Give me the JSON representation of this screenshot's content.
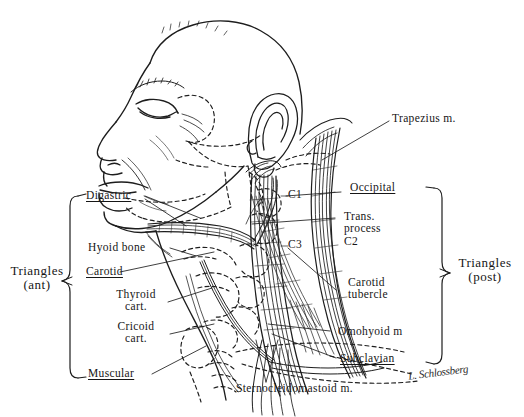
{
  "figure": {
    "ink_color": "#1d1d1d",
    "background": "#ffffff"
  },
  "brackets": {
    "left": {
      "label_line1": "Triangles",
      "label_line2": "(ant)"
    },
    "right": {
      "label_line1": "Triangles",
      "label_line2": "(post)"
    }
  },
  "labels": {
    "digastric": "Digastric",
    "hyoid_bone": "Hyoid bone",
    "carotid": "Carotid",
    "thyroid_cart_1": "Thyroid",
    "thyroid_cart_2": "cart.",
    "cricoid_cart_1": "Cricoid",
    "cricoid_cart_2": "cart.",
    "muscular": "Muscular",
    "trapezius": "Trapezius m.",
    "occipital": "Occipital",
    "trans_process_1": "Trans.",
    "trans_process_2": "process",
    "trans_process_3": "C2",
    "c1": "C1",
    "c3": "C3",
    "carotid_tubercle_1": "Carotid",
    "carotid_tubercle_2": "tubercle",
    "omohyoid": "Omohyoid m",
    "subclavian": "Subclavian",
    "sternocleidomastoid": "Sternocleidomastoid m.",
    "signature": "L. Schlossberg"
  }
}
